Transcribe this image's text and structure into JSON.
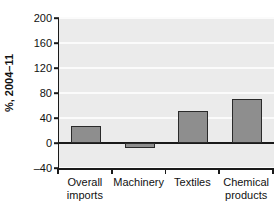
{
  "chart_data": {
    "type": "bar",
    "title": "",
    "subtitle": "",
    "xlabel": "",
    "ylabel": "%, 2004–11",
    "categories": [
      "Overall imports",
      "Machinery",
      "Textiles",
      "Chemical products"
    ],
    "category_lines": [
      [
        "Overall",
        "imports"
      ],
      [
        "Machinery"
      ],
      [
        "Textiles"
      ],
      [
        "Chemical",
        "products"
      ]
    ],
    "values": [
      28,
      -8,
      52,
      70
    ],
    "ylim": [
      -40,
      200
    ],
    "yticks": [
      -40,
      0,
      40,
      80,
      120,
      160,
      200
    ],
    "ytick_labels": [
      "–40",
      "0",
      "40",
      "80",
      "120",
      "160",
      "200"
    ],
    "grid": "horizontal",
    "legend": "none",
    "colors": {
      "bar_fill": "#8e8e8e",
      "bar_border": "#2a2a2a",
      "plot_background": "#ebebeb",
      "gridline": "#fbfbfb",
      "axis": "#1a1a1a",
      "text": "#111111",
      "page_background": "#ffffff"
    }
  }
}
